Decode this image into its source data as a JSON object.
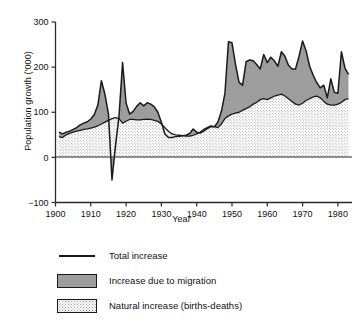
{
  "chart_data": {
    "type": "area",
    "title": "",
    "xlabel": "Year",
    "ylabel": "Population growth ('000)",
    "xlim": [
      1900,
      1984
    ],
    "ylim": [
      -100,
      300
    ],
    "xticks": [
      1900,
      1910,
      1920,
      1930,
      1940,
      1950,
      1960,
      1970,
      1980
    ],
    "yticks": [
      -100,
      0,
      100,
      200,
      300
    ],
    "grid": false,
    "legend_position": "below-left",
    "stacked": true,
    "x": [
      1901,
      1902,
      1903,
      1904,
      1905,
      1906,
      1907,
      1908,
      1909,
      1910,
      1911,
      1912,
      1913,
      1914,
      1915,
      1916,
      1917,
      1918,
      1919,
      1920,
      1921,
      1922,
      1923,
      1924,
      1925,
      1926,
      1927,
      1928,
      1929,
      1930,
      1931,
      1932,
      1933,
      1934,
      1935,
      1936,
      1937,
      1938,
      1939,
      1940,
      1941,
      1942,
      1943,
      1944,
      1945,
      1946,
      1947,
      1948,
      1949,
      1950,
      1951,
      1952,
      1953,
      1954,
      1955,
      1956,
      1957,
      1958,
      1959,
      1960,
      1961,
      1962,
      1963,
      1964,
      1965,
      1966,
      1967,
      1968,
      1969,
      1970,
      1971,
      1972,
      1973,
      1974,
      1975,
      1976,
      1977,
      1978,
      1979,
      1980,
      1981,
      1982,
      1983
    ],
    "series": [
      {
        "name": "Natural increase (births-deaths)",
        "color": "#f2f2f2",
        "pattern": "dotted",
        "values": [
          46,
          44,
          50,
          53,
          56,
          58,
          60,
          62,
          63,
          65,
          67,
          70,
          74,
          78,
          82,
          86,
          88,
          86,
          76,
          80,
          84,
          84,
          83,
          83,
          84,
          85,
          84,
          82,
          80,
          74,
          66,
          58,
          52,
          50,
          49,
          48,
          47,
          47,
          49,
          52,
          56,
          62,
          66,
          70,
          68,
          66,
          74,
          86,
          92,
          96,
          98,
          100,
          104,
          108,
          112,
          118,
          122,
          128,
          130,
          128,
          132,
          136,
          138,
          140,
          136,
          130,
          124,
          118,
          116,
          120,
          126,
          130,
          134,
          136,
          132,
          124,
          118,
          116,
          116,
          118,
          122,
          128,
          130
        ]
      },
      {
        "name": "Increase due to migration",
        "color": "#9d9d9d",
        "pattern": "solid",
        "values": [
          10,
          8,
          6,
          5,
          6,
          8,
          12,
          14,
          16,
          20,
          28,
          46,
          96,
          62,
          14,
          -136,
          -62,
          6,
          134,
          40,
          12,
          18,
          30,
          38,
          30,
          36,
          34,
          30,
          20,
          4,
          -14,
          -14,
          -8,
          -4,
          -2,
          0,
          2,
          6,
          14,
          4,
          -2,
          -4,
          -2,
          -2,
          0,
          12,
          28,
          56,
          164,
          158,
          108,
          66,
          56,
          104,
          104,
          96,
          84,
          68,
          98,
          82,
          90,
          78,
          64,
          94,
          88,
          74,
          72,
          78,
          108,
          138,
          110,
          72,
          48,
          30,
          22,
          36,
          14,
          58,
          28,
          24,
          112,
          70,
          54
        ]
      }
    ],
    "total_line": {
      "name": "Total increase",
      "color": "#1a1a1a",
      "values": [
        56,
        52,
        56,
        58,
        62,
        66,
        72,
        76,
        79,
        85,
        95,
        116,
        170,
        140,
        96,
        -50,
        26,
        92,
        210,
        120,
        96,
        102,
        113,
        121,
        114,
        121,
        118,
        112,
        100,
        78,
        52,
        44,
        44,
        46,
        47,
        48,
        49,
        53,
        63,
        56,
        54,
        58,
        64,
        68,
        68,
        78,
        102,
        142,
        256,
        254,
        206,
        166,
        160,
        212,
        216,
        214,
        206,
        196,
        228,
        210,
        222,
        214,
        202,
        234,
        224,
        204,
        196,
        196,
        224,
        258,
        236,
        202,
        182,
        166,
        154,
        160,
        132,
        174,
        144,
        142,
        234,
        198,
        184
      ]
    }
  },
  "legend": {
    "items": [
      {
        "key": "line",
        "label": "Total increase"
      },
      {
        "key": "migration",
        "label": "Increase due to migration"
      },
      {
        "key": "natural",
        "label": "Natural increase (births-deaths)"
      }
    ]
  }
}
